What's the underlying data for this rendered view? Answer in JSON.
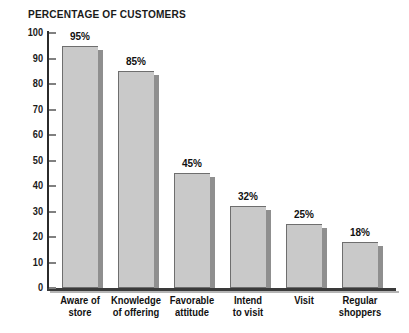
{
  "chart_data": {
    "type": "bar",
    "title": "PERCENTAGE OF CUSTOMERS",
    "xlabel": "",
    "ylabel": "",
    "ylim": [
      0,
      100
    ],
    "grid": false,
    "legend": "none",
    "yticks": [
      0,
      10,
      20,
      30,
      40,
      50,
      60,
      70,
      80,
      90,
      100
    ],
    "ytick_labels": [
      "0",
      "10",
      "20",
      "30",
      "40",
      "50",
      "60",
      "70",
      "80",
      "90",
      "100"
    ],
    "categories": [
      "Aware of store",
      "Knowledge of offering",
      "Favorable attitude",
      "Intend to visit",
      "Visit",
      "Regular shoppers"
    ],
    "category_lines": [
      [
        "Aware of",
        "store"
      ],
      [
        "Knowledge",
        "of offering"
      ],
      [
        "Favorable",
        "attitude"
      ],
      [
        "Intend",
        "to visit"
      ],
      [
        "Visit",
        ""
      ],
      [
        "Regular",
        "shoppers"
      ]
    ],
    "values": [
      95,
      85,
      45,
      32,
      25,
      18
    ],
    "data_labels": [
      "95%",
      "85%",
      "45%",
      "32%",
      "25%",
      "18%"
    ],
    "colors": {
      "bar_fill": "#c9c9c9",
      "bar_outline": "#6e6e6e",
      "bar_shadow": "#8f8f8f",
      "axis": "#2b2b2b",
      "text": "#111111",
      "background": "#ffffff"
    }
  }
}
